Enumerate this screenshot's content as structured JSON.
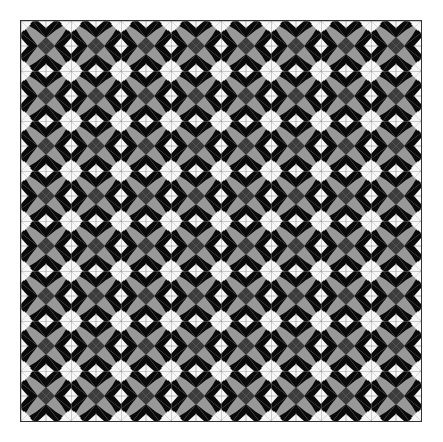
{
  "image": {
    "title": "Geometric quilt pattern",
    "description": "8 by 8 repeating tile pattern of white eight-pointed stars, black kites, light gray blades and dark gray center diamonds"
  },
  "pattern": {
    "rows": 8,
    "cols": 8,
    "tile_size_px": 50,
    "colors": {
      "background": "#f2f2f2",
      "white": "#f7f7f7",
      "black": "#0a0a0a",
      "light_gray": "#999999",
      "dark_gray": "#3c3c3c",
      "line": "#8a8a8a",
      "border": "#333333"
    }
  }
}
